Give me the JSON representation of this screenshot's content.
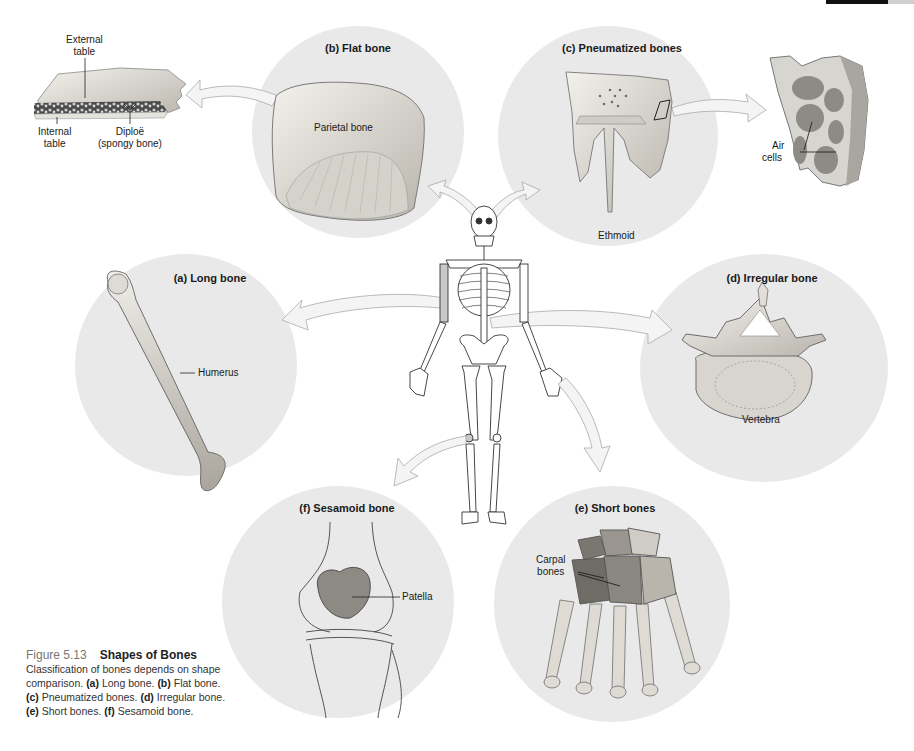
{
  "figure": {
    "number": "Figure 5.13",
    "title": "Shapes of Bones",
    "caption_intro": "Classification of bones depends on shape comparison.",
    "caption_items": [
      {
        "key": "(a)",
        "text": "Long bone."
      },
      {
        "key": "(b)",
        "text": "Flat bone."
      },
      {
        "key": "(c)",
        "text": "Pneumatized bones."
      },
      {
        "key": "(d)",
        "text": "Irregular bone."
      },
      {
        "key": "(e)",
        "text": "Short bones."
      },
      {
        "key": "(f)",
        "text": "Sesamoid bone."
      }
    ]
  },
  "panels": {
    "a": {
      "title": "(a) Long bone",
      "labels": [
        "Humerus"
      ]
    },
    "b": {
      "title": "(b) Flat bone",
      "labels": [
        "Parietal bone"
      ]
    },
    "c": {
      "title": "(c) Pneumatized bones",
      "labels": [
        "Ethmoid"
      ]
    },
    "d": {
      "title": "(d) Irregular bone",
      "labels": [
        "Vertebra"
      ]
    },
    "e": {
      "title": "(e) Short bones",
      "labels": [
        "Carpal",
        "bones"
      ]
    },
    "f": {
      "title": "(f) Sesamoid bone",
      "labels": [
        "Patella"
      ]
    }
  },
  "flat_bone_detail": {
    "labels": {
      "external_table": [
        "External",
        "table"
      ],
      "internal_table": [
        "Internal",
        "table"
      ],
      "diploe": [
        "Diploë",
        "(spongy bone)"
      ]
    }
  },
  "air_cells_detail": {
    "labels": [
      "Air",
      "cells"
    ]
  },
  "colors": {
    "circle_bg": "#e9e9e9",
    "bone": "#d9d6cf",
    "arrow": "#f2f2f2",
    "line": "#222222"
  }
}
